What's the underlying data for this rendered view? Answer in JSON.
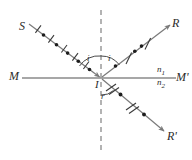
{
  "figure": {
    "background_color": "#ffffff",
    "line_color": "#6f6f6f",
    "ink_color": "#2b2b2b",
    "width": 192,
    "height": 160
  },
  "labels": {
    "source_ray": "S",
    "reflected_ray": "R",
    "refracted_ray": "R'",
    "interface_left": "M",
    "interface_right": "M'",
    "incidence_point": "I",
    "angle_incidence": "i",
    "angle_reflection": "i",
    "angle_refraction": "r",
    "index_upper": "n",
    "index_upper_sub": "1",
    "index_lower": "n",
    "index_lower_sub": "2"
  },
  "geometry": {
    "incidence_point_px": {
      "x": 101,
      "y": 78
    },
    "interface_line": {
      "x1": 22,
      "y1": 78,
      "x2": 176,
      "y2": 78
    },
    "normal_line": {
      "x1": 101,
      "y1": 10,
      "x2": 101,
      "y2": 152,
      "style": "dashed"
    },
    "incident_ray": {
      "x1": 30,
      "y1": 25,
      "x2": 101,
      "y2": 78,
      "arrow": "toward-I"
    },
    "reflected_ray": {
      "x1": 101,
      "y1": 78,
      "x2": 172,
      "y2": 24,
      "arrow": "away-from-I"
    },
    "refracted_ray": {
      "x1": 101,
      "y1": 78,
      "x2": 166,
      "y2": 133,
      "arrow": "away-from-I"
    },
    "incident_markers": {
      "ticks": 5,
      "dots": 5,
      "pattern": "alternating tick-dot"
    },
    "reflected_markers": {
      "ticks": 2,
      "dots": 3,
      "pattern": "alternating dot-tick"
    },
    "refracted_markers": {
      "ticks": 2,
      "dots": 3,
      "pattern": "alternating tick-dot"
    },
    "angle_arc_incidence": {
      "radius": 22
    },
    "angle_arc_reflection": {
      "radius": 22
    },
    "angle_arc_refraction": {
      "radius": 17
    }
  }
}
